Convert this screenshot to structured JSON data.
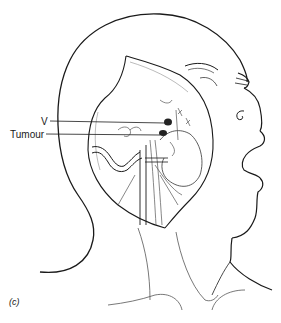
{
  "figure": {
    "panel_label": "(c)",
    "annotations": [
      {
        "id": "v",
        "text": "V"
      },
      {
        "id": "tumour",
        "text": "Tumour"
      }
    ],
    "colors": {
      "line": "#1a1a1a",
      "fine_line": "#555555",
      "background": "#ffffff",
      "dark_structure": "#222222"
    }
  }
}
